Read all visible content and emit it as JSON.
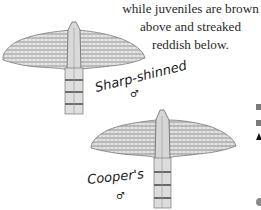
{
  "caption": {
    "lines": [
      "while juveniles are brown",
      "above and streaked",
      "reddish below."
    ]
  },
  "figures": [
    {
      "name": "Sharp-shinned",
      "label": "Sharp-shinned",
      "sex_symbol": "♂",
      "icon": "hawk-silhouette"
    },
    {
      "name": "Cooper's",
      "label": "Cooper's",
      "sex_symbol": "♂",
      "icon": "hawk-silhouette"
    }
  ],
  "edge_markers": [
    "gray-square",
    "gray-square",
    "black-triangle",
    "gray-circle"
  ],
  "colors": {
    "ink": "#2a2a2a",
    "sketch": "#6d6d6d",
    "marker_gray": "#7a7a7a"
  }
}
